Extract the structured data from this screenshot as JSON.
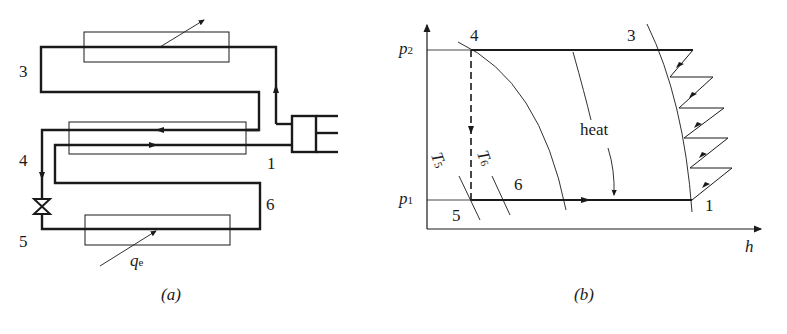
{
  "panel_a": {
    "caption": "(a)",
    "state_labels": {
      "s3": "3",
      "s4": "4",
      "s1": "1",
      "s6": "6",
      "s5": "5"
    },
    "heat_label": {
      "base": "q",
      "sub": "e"
    },
    "components": [
      "condenser",
      "internal-heat-exchanger",
      "evaporator",
      "expansion-valve",
      "compressor"
    ]
  },
  "panel_b": {
    "caption": "(b)",
    "axis": {
      "x_label": "h",
      "y_ticks": [
        {
          "base": "p",
          "sub": "2"
        },
        {
          "base": "p",
          "sub": "1"
        }
      ]
    },
    "state_labels": {
      "s4": "4",
      "s3": "3",
      "s6": "6",
      "s5": "5",
      "s1": "1"
    },
    "isotherm_labels": [
      {
        "base": "T",
        "sub": "5"
      },
      {
        "base": "T",
        "sub": "6"
      }
    ],
    "heat_text": "heat",
    "staged_compression_steps": 5
  }
}
